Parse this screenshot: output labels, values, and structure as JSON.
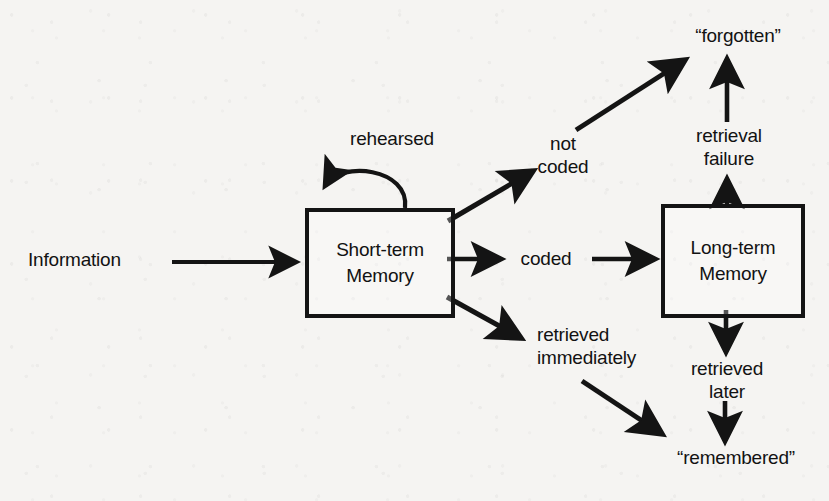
{
  "diagram": {
    "background_color": "#f5f4f2",
    "ink_color": "#141414",
    "nodes": {
      "short_term": {
        "line1": "Short-term",
        "line2": "Memory"
      },
      "long_term": {
        "line1": "Long-term",
        "line2": "Memory"
      }
    },
    "labels": {
      "information": "Information",
      "rehearsed": "rehearsed",
      "not_coded_line1": "not",
      "not_coded_line2": "coded",
      "forgotten": "“forgotten”",
      "retrieval_failure_line1": "retrieval",
      "retrieval_failure_line2": "failure",
      "coded": "coded",
      "retrieved_immediately_line1": "retrieved",
      "retrieved_immediately_line2": "immediately",
      "retrieved_later_line1": "retrieved",
      "retrieved_later_line2": "later",
      "remembered": "“remembered”"
    },
    "edges": [
      {
        "name": "information-to-short-term",
        "from": "Information",
        "to": "Short-term Memory",
        "label": ""
      },
      {
        "name": "short-term-rehearsal-loop",
        "from": "Short-term Memory",
        "to": "Short-term Memory",
        "label": "rehearsed"
      },
      {
        "name": "short-term-to-not-coded",
        "from": "Short-term Memory",
        "to": "not coded",
        "label": "not coded"
      },
      {
        "name": "not-coded-to-forgotten",
        "from": "not coded",
        "to": "“forgotten”",
        "label": ""
      },
      {
        "name": "short-term-to-long-term",
        "from": "Short-term Memory",
        "to": "Long-term Memory",
        "label": "coded"
      },
      {
        "name": "short-term-to-retrieved-immediately",
        "from": "Short-term Memory",
        "to": "retrieved immediately",
        "label": "retrieved immediately"
      },
      {
        "name": "long-term-to-forgotten",
        "from": "Long-term Memory",
        "to": "“forgotten”",
        "label": "retrieval failure"
      },
      {
        "name": "long-term-to-remembered",
        "from": "Long-term Memory",
        "to": "“remembered”",
        "label": "retrieved later"
      },
      {
        "name": "retrieved-immediately-to-remembered",
        "from": "retrieved immediately",
        "to": "“remembered”",
        "label": ""
      }
    ]
  }
}
